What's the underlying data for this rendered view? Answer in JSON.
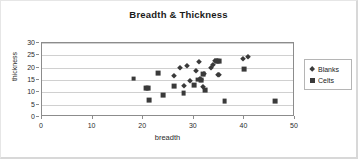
{
  "chart_data": {
    "type": "scatter",
    "title": "Breadth & Thickness",
    "xlabel": "breadth",
    "ylabel": "thickness",
    "xlim": [
      0,
      50
    ],
    "ylim": [
      0,
      30
    ],
    "xticks": [
      0,
      10,
      20,
      30,
      40,
      50
    ],
    "yticks": [
      0,
      5,
      10,
      15,
      20,
      25,
      30
    ],
    "grid": "horizontal",
    "legend_position": "right",
    "series": [
      {
        "name": "Blanks",
        "marker": "diamond",
        "color": "#3a3a3a",
        "points": [
          [
            26.0,
            16.6
          ],
          [
            27.2,
            19.7
          ],
          [
            28.1,
            12.6
          ],
          [
            28.6,
            20.5
          ],
          [
            29.2,
            14.4
          ],
          [
            30.4,
            18.5
          ],
          [
            31.0,
            22.3
          ],
          [
            31.2,
            15.6
          ],
          [
            31.4,
            14.8
          ],
          [
            31.8,
            12.0
          ],
          [
            32.0,
            17.6
          ],
          [
            33.4,
            19.7
          ],
          [
            33.8,
            20.9
          ],
          [
            34.2,
            22.6
          ],
          [
            34.6,
            22.6
          ],
          [
            34.8,
            17.0
          ],
          [
            35.0,
            17.2
          ],
          [
            39.8,
            23.7
          ],
          [
            40.8,
            24.3
          ]
        ]
      },
      {
        "name": "Celts",
        "marker": "square",
        "color": "#3a3a3a",
        "points": [
          [
            18.1,
            15.6
          ],
          [
            20.6,
            11.8
          ],
          [
            21.0,
            11.8
          ],
          [
            21.2,
            6.7
          ],
          [
            23.0,
            17.7
          ],
          [
            24.0,
            8.8
          ],
          [
            26.1,
            12.6
          ],
          [
            28.0,
            9.8
          ],
          [
            30.0,
            12.8
          ],
          [
            30.8,
            15.2
          ],
          [
            31.4,
            15.1
          ],
          [
            31.8,
            17.5
          ],
          [
            32.2,
            10.8
          ],
          [
            34.6,
            22.6
          ],
          [
            35.0,
            22.6
          ],
          [
            36.1,
            6.5
          ],
          [
            39.9,
            19.5
          ],
          [
            46.0,
            6.3
          ]
        ]
      }
    ]
  },
  "legend": {
    "items": [
      {
        "label": "Blanks",
        "marker": "diamond"
      },
      {
        "label": "Celts",
        "marker": "square"
      }
    ]
  }
}
